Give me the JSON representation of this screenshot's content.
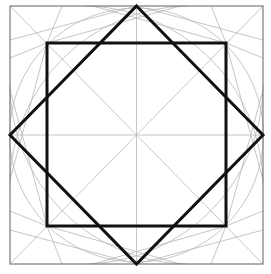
{
  "diagram": {
    "width": 271,
    "height": 274,
    "colors": {
      "background": "#ffffff",
      "frame": "#7a7a7a",
      "guide": "#b8b8b8",
      "bold": "#111111"
    },
    "frame": {
      "x1": 10,
      "y1": 6,
      "x2": 263,
      "y2": 264
    },
    "center": {
      "x": 136.5,
      "y": 135
    },
    "circle_radius": 126,
    "square": {
      "x1": 47,
      "y1": 43,
      "x2": 226,
      "y2": 226
    },
    "diamond": [
      [
        136.5,
        6
      ],
      [
        263,
        135
      ],
      [
        136.5,
        264
      ],
      [
        10,
        135
      ]
    ]
  }
}
